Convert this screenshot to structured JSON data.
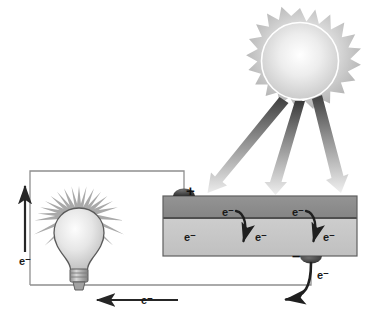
{
  "diagram": {
    "background_color": "#ffffff"
  },
  "sun": {
    "name": "sun",
    "body_color_outer": "#b4b4b4",
    "body_color_inner": "#f2f2f2",
    "ring_color": "#ffffff",
    "center": {
      "x": 300,
      "y": 62
    },
    "radius_outer": 52,
    "radius_inner": 38,
    "spike_count": 22
  },
  "light_rays": {
    "label": "sunlight rays",
    "count": 3,
    "color_top": "#4a4a4a",
    "color_bottom": "#e8e8e8",
    "rays": [
      {
        "name": "light-ray-1",
        "x1": 283,
        "y1": 100,
        "x2": 214,
        "y2": 192
      },
      {
        "name": "light-ray-2",
        "x1": 300,
        "y1": 104,
        "x2": 275,
        "y2": 192
      },
      {
        "name": "light-ray-3",
        "x1": 316,
        "y1": 100,
        "x2": 337,
        "y2": 192
      }
    ]
  },
  "solar_panel": {
    "name": "solar cell panel",
    "x": 163,
    "y": 196,
    "width": 194,
    "height": 60,
    "top_layer": {
      "label": "n-type layer",
      "color": "#8b8b8b",
      "height": 22
    },
    "bottom_layer": {
      "label": "p-type layer",
      "color": "#c6c6c6",
      "height": 38
    },
    "junction_color": "#4d4d4d",
    "border_color": "#5a5a5a"
  },
  "terminals": {
    "positive": {
      "name": "positive-terminal",
      "symbol": "+",
      "x": 186,
      "y": 196,
      "pad_color": "#3c3c3c"
    },
    "negative": {
      "name": "negative-terminal",
      "symbol": "–",
      "x": 311,
      "y": 256,
      "pad_color": "#3c3c3c"
    }
  },
  "electron_labels": [
    {
      "name": "electron-label-panel-top-left",
      "text": "e⁻",
      "x": 228,
      "y": 216
    },
    {
      "name": "electron-label-panel-top-right",
      "text": "e⁻",
      "x": 298,
      "y": 216
    },
    {
      "name": "electron-label-panel-bot-left",
      "text": "e⁻",
      "x": 190,
      "y": 239
    },
    {
      "name": "electron-label-panel-bot-mid",
      "text": "e⁻",
      "x": 261,
      "y": 239
    },
    {
      "name": "electron-label-panel-bot-right",
      "text": "e⁻",
      "x": 327,
      "y": 239
    },
    {
      "name": "electron-label-left-wire",
      "text": "e⁻",
      "x": 13,
      "y": 262
    },
    {
      "name": "electron-label-bottom-wire",
      "text": "e⁻",
      "x": 147,
      "y": 301
    },
    {
      "name": "electron-label-right-return",
      "text": "e⁻",
      "x": 321,
      "y": 277
    }
  ],
  "panel_arrows": [
    {
      "name": "electron-jump-arrow-left",
      "from_x": 238,
      "from_y": 210,
      "to_x": 245,
      "to_y": 246
    },
    {
      "name": "electron-jump-arrow-right",
      "from_x": 308,
      "from_y": 210,
      "to_x": 315,
      "to_y": 246
    }
  ],
  "circuit": {
    "name": "external circuit wire",
    "color": "#8a8a8a",
    "left_x": 30,
    "right_x": 184,
    "top_y": 171,
    "bottom_y": 285
  },
  "bulb": {
    "name": "light-bulb",
    "center_x": 79,
    "center_y": 238,
    "glass_color_light": "#f4f4f4",
    "glass_color_dark": "#b9b9b9",
    "base_color": "#9a9a9a",
    "ray_color": "#a8a8a8",
    "ray_count": 20,
    "label": "glowing light bulb"
  },
  "flow_arrows": {
    "left_vertical": {
      "name": "electron-flow-arrow-up",
      "direction": "up",
      "x": 25,
      "y_start": 252,
      "y_end": 184
    },
    "bottom_horizontal": {
      "name": "electron-flow-arrow-left",
      "direction": "left",
      "y": 300,
      "x_start": 178,
      "x_end": 95
    },
    "right_return": {
      "name": "electron-return-curved-arrow",
      "direction": "down-left",
      "start_x": 311,
      "start_y": 262,
      "end_x": 281,
      "end_y": 300
    }
  },
  "colors": {
    "ink": "#1a1a1a",
    "wire": "#8a8a8a",
    "arrow": "#262626",
    "panel_top": "#8b8b8b",
    "panel_bottom": "#c6c6c6"
  }
}
